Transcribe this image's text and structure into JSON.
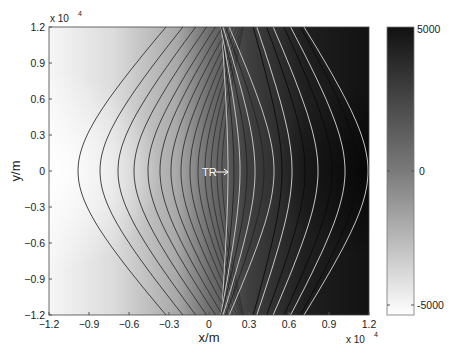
{
  "chart_data": {
    "type": "contour",
    "title": "",
    "xlabel": "x/m",
    "ylabel": "y/m",
    "x_scale_label": "x 10",
    "x_scale_exp": "4",
    "y_scale_label": "x 10",
    "y_scale_exp": "4",
    "xlim": [
      -12000,
      12000
    ],
    "ylim": [
      -12000,
      12000
    ],
    "xticks": [
      "-1.2",
      "-0.9",
      "-0.6",
      "-0.3",
      "0",
      "0.3",
      "0.6",
      "0.9",
      "1.2"
    ],
    "yticks": [
      "1.2",
      "0.9",
      "0.6",
      "0.3",
      "0",
      "-0.3",
      "-0.6",
      "-0.9",
      "-1.2"
    ],
    "annotation": {
      "text": "TR",
      "x": -200,
      "y": 0,
      "arrow": "right"
    },
    "colorbar": {
      "range": [
        -5000,
        5000
      ],
      "ticks": [
        "5000",
        "0",
        "-5000"
      ],
      "colormap": "gray (white = -5000, black = 5000)"
    }
  }
}
